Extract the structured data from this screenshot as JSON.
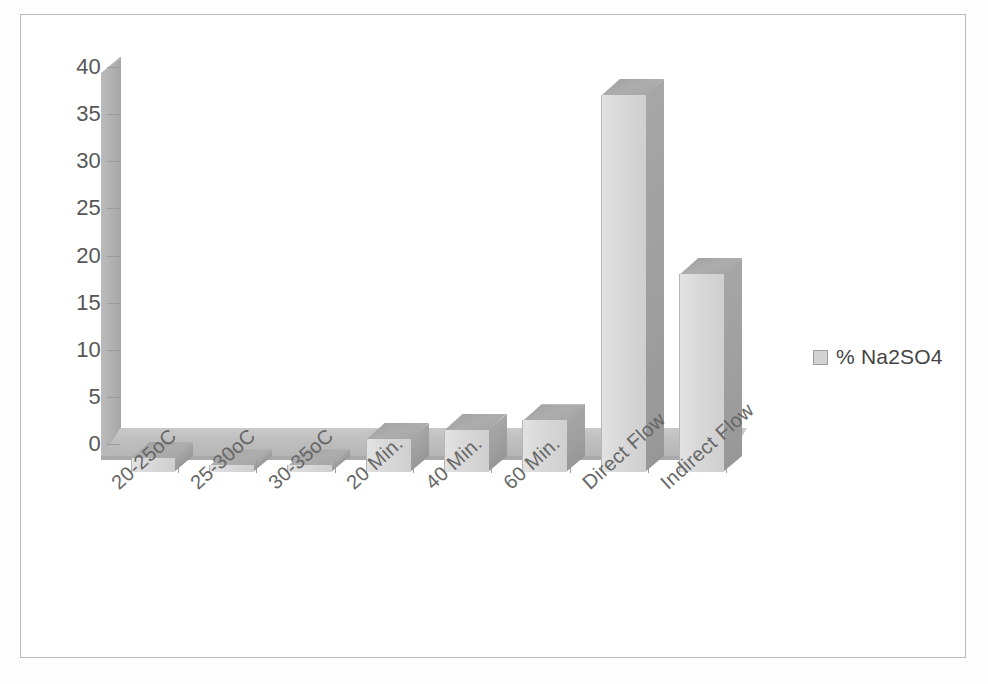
{
  "chart_data": {
    "type": "bar",
    "title": "",
    "subtitle": "",
    "xlabel": "",
    "ylabel": "",
    "categories": [
      "20-25oC",
      "25-30oC",
      "30-35oC",
      "20 Min.",
      "40 Min.",
      "60 Min.",
      "Direct Flow",
      "Indirect Flow"
    ],
    "series": [
      {
        "name": "% Na2SO4",
        "values": [
          1.5,
          0.7,
          0.7,
          3.5,
          4.5,
          5.5,
          40,
          21
        ]
      }
    ],
    "ylim": [
      0,
      40
    ],
    "yticks": [
      0,
      5,
      10,
      15,
      20,
      25,
      30,
      35,
      40
    ],
    "ytick_labels": [
      "0",
      "5",
      "10",
      "15",
      "20",
      "25",
      "30",
      "35",
      "40"
    ],
    "grid": false,
    "legend_position": "right",
    "style": "3d-column",
    "colors": {
      "bar_front": "#d9d9d9",
      "bar_side": "#9e9e9e",
      "bar_top": "#a8a8a8",
      "floor": "#bdbdbd",
      "wall": "#b0b0b0",
      "axis_text": "#575757",
      "label_text": "#666666",
      "frame_border": "#b9b9b9",
      "background": "#ffffff"
    }
  },
  "legend": {
    "entries": [
      {
        "label": "% Na2SO4",
        "swatch_color": "#d3d3d3",
        "icon": "legend-swatch-icon"
      }
    ]
  },
  "axes": {
    "y": {
      "ticks": [
        "40",
        "35",
        "30",
        "25",
        "20",
        "15",
        "10",
        "5",
        "0"
      ]
    },
    "x": {
      "ticks": [
        "20-25oC",
        "25-30oC",
        "30-35oC",
        "20 Min.",
        "40 Min.",
        "60 Min.",
        "Direct Flow",
        "Indirect Flow"
      ]
    }
  }
}
